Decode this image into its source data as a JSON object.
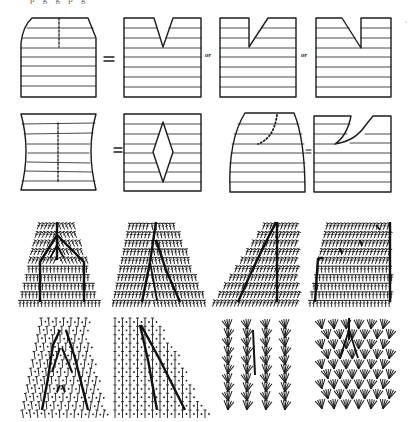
{
  "figure": {
    "caption_fragment": "p    g g   p      g",
    "colors": {
      "ink": "#1c1c1c",
      "paper": "#ffffff"
    },
    "row1": {
      "description": "Tapered block with dashed center line equals a block with a V-notch, or a left slant notch, or a right slant notch",
      "equals_label": "=",
      "or_labels": [
        "or",
        "or"
      ],
      "panels": [
        "tapered-top-with-dart",
        "center-v-notch",
        "left-slant-notch",
        "right-slant-notch"
      ]
    },
    "row2": {
      "description": "Waisted block with dashed line equals a block with a diamond opening; curved-dart block equals a block with a curved notch",
      "equals_labels": [
        "=",
        "="
      ],
      "panels": [
        "hourglass-with-dart",
        "diamond-opening",
        "rounded-top-with-curved-dart",
        "curved-notch"
      ]
    },
    "row3": {
      "description": "Crochet stitch charts of increase patterns",
      "panels": [
        "symmetric-branching-chart",
        "offset-branching-chart",
        "single-diagonal-chart",
        "stepped-increase-chart"
      ]
    },
    "row4": {
      "description": "Crochet mesh and fan-stitch charts",
      "panels": [
        "mesh-chevron-chart",
        "mesh-diagonal-chart",
        "fan-stitch-columns",
        "fan-stitch-branching"
      ]
    }
  }
}
